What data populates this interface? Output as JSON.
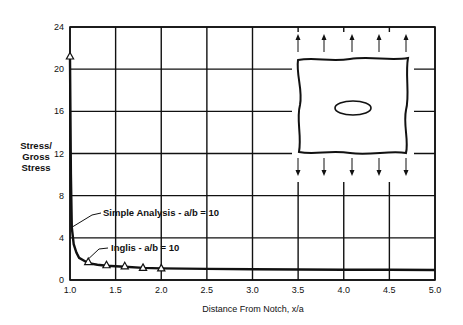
{
  "chart_data": {
    "type": "line",
    "title": "",
    "xlabel": "Distance From Notch, x/a",
    "ylabel": "Stress/ Gross Stress",
    "ylabel_lines": [
      "Stress/",
      "Gross",
      "Stress"
    ],
    "xlim": [
      1.0,
      5.0
    ],
    "ylim": [
      0,
      24
    ],
    "x_ticks": [
      "1.0",
      "1.5",
      "2.0",
      "2.5",
      "3.0",
      "3.5",
      "4.0",
      "4.5",
      "5.0"
    ],
    "y_ticks": [
      "0",
      "4",
      "8",
      "12",
      "16",
      "20",
      "24"
    ],
    "grid": true,
    "series": [
      {
        "name": "Simple Analysis - a/b = 10",
        "style": "solid line",
        "x": [
          1.0,
          1.01,
          1.02,
          1.04,
          1.07,
          1.1,
          1.15,
          1.2,
          1.3,
          1.4,
          1.6,
          1.8,
          2.0,
          2.5,
          3.0,
          3.5,
          4.0,
          4.5,
          5.0
        ],
        "y": [
          21.0,
          10.0,
          5.0,
          3.4,
          2.6,
          2.1,
          1.85,
          1.6,
          1.45,
          1.35,
          1.25,
          1.15,
          1.1,
          1.05,
          1.02,
          1.0,
          0.98,
          0.97,
          0.95
        ]
      },
      {
        "name": "Inglis - a/b = 10",
        "style": "triangle markers",
        "x": [
          1.0,
          1.2,
          1.4,
          1.6,
          1.8,
          2.0
        ],
        "y": [
          21.2,
          1.7,
          1.4,
          1.3,
          1.15,
          1.1
        ]
      }
    ],
    "annotations": [
      {
        "text": "Simple Analysis - a/b = 10",
        "points_to_x": 1.02,
        "points_to_y": 5.0
      },
      {
        "text": "Inglis - a/b = 10",
        "points_to_x": 1.2,
        "points_to_y": 1.7
      }
    ],
    "inset": "Plate with central elliptical hole under uniaxial tension (arrows above and below)"
  }
}
